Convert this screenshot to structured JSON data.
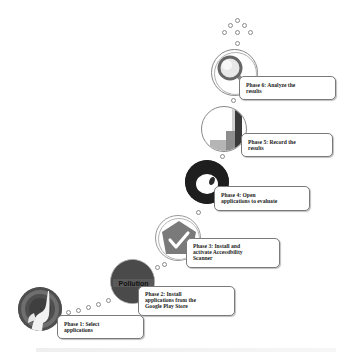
{
  "diagram": {
    "type": "staircase-process",
    "phases": [
      {
        "id": 1,
        "label": "Phase 1: Select applications",
        "line1": "Phase 1: Select",
        "line2": "applications",
        "line3": "",
        "icon": "elephant-app-icon",
        "icon_color": "#5a5a5a"
      },
      {
        "id": 2,
        "label": "Phase 2: Install applications from the Google Play Store",
        "line1": "Phase 2: Install",
        "line2": "applications from the",
        "line3": "Google Play Store",
        "icon": "pollution-app-icon",
        "icon_text": "Pollution",
        "icon_color": "#444444"
      },
      {
        "id": 3,
        "label": "Phase 3: Install and activate Accessibility Scanner",
        "line1": "Phase 3: Install and",
        "line2": "activate Accessibility",
        "line3": "Scanner",
        "icon": "checkmark-shield-icon",
        "icon_color": "#7a7a7a"
      },
      {
        "id": 4,
        "label": "Phase 4: Open applications to evaluate",
        "line1": "Phase 4: Open",
        "line2": "applications to evaluate",
        "line3": "",
        "icon": "ring-app-icon",
        "icon_color": "#1e1e1e"
      },
      {
        "id": 5,
        "label": "Phase 5: Record the results",
        "line1": "Phase 5: Record the",
        "line2": "results",
        "line3": "",
        "icon": "bar-chart-icon",
        "icon_color": "#9a9a9a"
      },
      {
        "id": 6,
        "label": "Phase 6: Analyze the results",
        "line1": "Phase 6: Analyze the",
        "line2": "results",
        "line3": "",
        "icon": "magnifier-icon",
        "icon_color": "#a0a0a0"
      }
    ]
  }
}
